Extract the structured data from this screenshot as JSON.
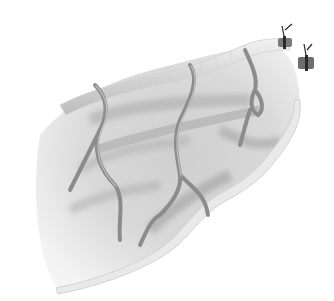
{
  "image": {
    "description": "Grayscale anatomical illustration of a folded tissue segment with branching blood vessels and two tied-off vessel ends at upper right",
    "width": 334,
    "height": 301,
    "colors": {
      "background": "#ffffff",
      "tissue_light": "#e6e6e6",
      "tissue_mid": "#c8c8c8",
      "tissue_dark": "#9a9a9a",
      "border": "#d9d9d9",
      "vessel": "#8c8c8c",
      "vessel_edge": "#6a6a6a",
      "ligature": "#2a2a2a"
    }
  }
}
